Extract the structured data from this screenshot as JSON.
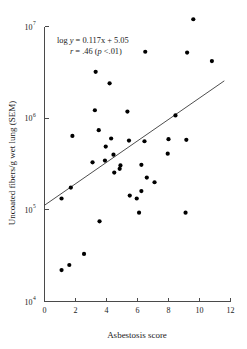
{
  "chart_data": {
    "type": "scatter",
    "title": "",
    "xlabel": "Asbestosis score",
    "ylabel": "Uncoated fibers/g wet lung (SEM)",
    "xlim": [
      0,
      12
    ],
    "ylim": [
      10000,
      10000000
    ],
    "yscale": "log",
    "xticks": [
      0,
      2,
      4,
      6,
      8,
      10,
      12
    ],
    "xtick_labels": [
      "0",
      "2",
      "4",
      "6",
      "8",
      "10",
      "12"
    ],
    "yticks": [
      10000,
      100000,
      1000000,
      10000000
    ],
    "ytick_labels": [
      "10",
      "10",
      "10",
      "10"
    ],
    "ytick_exponents": [
      "4",
      "5",
      "6",
      "7"
    ],
    "grid": false,
    "legend": "none",
    "annotations": [
      "log y = 0.117x + 5.05",
      "r = .46 (p <.01)"
    ],
    "annotation_parts": {
      "line1_prefix": "log ",
      "line1_y": "y",
      "line1_rest": " = 0.117x + 5.05",
      "line2_r": "r",
      "line2_mid": " = .46 (",
      "line2_p": "p",
      "line2_end": " <.01)"
    },
    "fit_line": {
      "slope_log10": 0.117,
      "intercept_log10": 5.05,
      "x_start": 0,
      "x_end": 11.6,
      "y_start": 112202,
      "y_end": 1096478
    },
    "points": [
      {
        "x": 1.1,
        "y": 22000
      },
      {
        "x": 1.1,
        "y": 133000
      },
      {
        "x": 1.6,
        "y": 25000
      },
      {
        "x": 1.7,
        "y": 175000
      },
      {
        "x": 1.8,
        "y": 640000
      },
      {
        "x": 2.55,
        "y": 33000
      },
      {
        "x": 3.1,
        "y": 330000
      },
      {
        "x": 3.25,
        "y": 1220000
      },
      {
        "x": 3.3,
        "y": 3200000
      },
      {
        "x": 3.5,
        "y": 740000
      },
      {
        "x": 3.55,
        "y": 75000
      },
      {
        "x": 3.9,
        "y": 345000
      },
      {
        "x": 3.95,
        "y": 490000
      },
      {
        "x": 4.2,
        "y": 2400000
      },
      {
        "x": 4.3,
        "y": 600000
      },
      {
        "x": 4.45,
        "y": 400000
      },
      {
        "x": 4.5,
        "y": 255000
      },
      {
        "x": 4.85,
        "y": 280000
      },
      {
        "x": 4.9,
        "y": 305000
      },
      {
        "x": 5.35,
        "y": 1180000
      },
      {
        "x": 5.45,
        "y": 570000
      },
      {
        "x": 5.5,
        "y": 143000
      },
      {
        "x": 5.95,
        "y": 133000
      },
      {
        "x": 6.1,
        "y": 93000
      },
      {
        "x": 6.25,
        "y": 160000
      },
      {
        "x": 6.25,
        "y": 310000
      },
      {
        "x": 6.45,
        "y": 560000
      },
      {
        "x": 6.5,
        "y": 5300000
      },
      {
        "x": 6.6,
        "y": 225000
      },
      {
        "x": 7.1,
        "y": 200000
      },
      {
        "x": 7.95,
        "y": 410000
      },
      {
        "x": 8.0,
        "y": 590000
      },
      {
        "x": 8.45,
        "y": 1070000
      },
      {
        "x": 9.1,
        "y": 93000
      },
      {
        "x": 9.15,
        "y": 580000
      },
      {
        "x": 9.2,
        "y": 5200000
      },
      {
        "x": 9.6,
        "y": 12000000
      },
      {
        "x": 10.8,
        "y": 4200000
      }
    ]
  }
}
